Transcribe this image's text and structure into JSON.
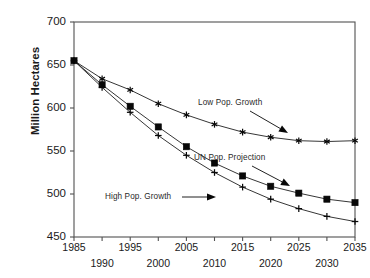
{
  "chart_data": {
    "type": "line",
    "title": "",
    "xlabel": "",
    "ylabel": "Million Hectares",
    "xlim": [
      1985,
      2035
    ],
    "ylim": [
      450,
      700
    ],
    "yticks": [
      450,
      500,
      550,
      600,
      650,
      700
    ],
    "xticks": [
      1985,
      1990,
      1995,
      2000,
      2005,
      2010,
      2015,
      2020,
      2025,
      2030,
      2035
    ],
    "xtick_labels_upper": [
      "1985",
      "1995",
      "2005",
      "2015",
      "2025",
      "2035"
    ],
    "xtick_labels_lower": [
      "1990",
      "2000",
      "2010",
      "2020",
      "2030"
    ],
    "grid": false,
    "legend": "none",
    "x": [
      1985,
      1990,
      1995,
      2000,
      2005,
      2010,
      2015,
      2020,
      2025,
      2030,
      2035
    ],
    "series": [
      {
        "name": "Low Pop. Growth",
        "marker": "star",
        "values": [
          655,
          634,
          621,
          605,
          592,
          581,
          572,
          566,
          562,
          561,
          562
        ]
      },
      {
        "name": "UN Pop. Projection",
        "marker": "square",
        "values": [
          655,
          627,
          602,
          578,
          555,
          536,
          521,
          509,
          501,
          494,
          490
        ]
      },
      {
        "name": "High Pop. Growth",
        "marker": "plus",
        "values": [
          655,
          624,
          595,
          568,
          545,
          525,
          508,
          494,
          483,
          474,
          468
        ]
      }
    ],
    "annotations": [
      {
        "text": "Low Pop. Growth",
        "target_series": "Low Pop. Growth",
        "arrow": "down-right"
      },
      {
        "text": "UN Pop. Projection",
        "target_series": "UN Pop. Projection",
        "arrow": "down-right"
      },
      {
        "text": "High Pop. Growth",
        "target_series": "High Pop. Growth",
        "arrow": "right"
      }
    ]
  },
  "axis": {
    "ylabels": [
      "700",
      "650",
      "600",
      "550",
      "500",
      "450"
    ],
    "xlabels_upper": [
      "1985",
      "1995",
      "2005",
      "2015",
      "2025",
      "2035"
    ],
    "xlabels_lower": [
      "1990",
      "2000",
      "2010",
      "2020",
      "2030"
    ],
    "ytitle": "Million Hectares"
  },
  "annotations": {
    "low": "Low Pop. Growth",
    "un": "UN Pop. Projection",
    "high": "High Pop. Growth"
  },
  "colors": {
    "line": "#1a1a1a",
    "frame": "#555555",
    "text": "#1a1a1a",
    "background": "#ffffff"
  }
}
